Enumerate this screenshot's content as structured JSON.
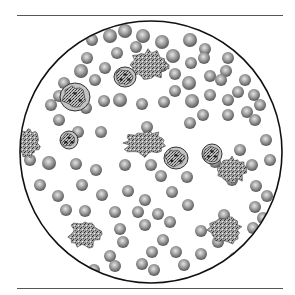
{
  "figure": {
    "colors": {
      "background": "#ffffff",
      "rule": "#555555",
      "field_outline": "#111111",
      "rbc_light": "#d8d8d8",
      "rbc_mid": "#9a9a9a",
      "rbc_dark": "#5a5a5a",
      "wbc_fill": "#b8b8b8",
      "wbc_nucleus": "#3a3a3a",
      "platelet_fill": "#8e8e8e"
    },
    "field": {
      "cx": 151,
      "cy": 152,
      "r": 131
    },
    "rbcs": [
      [
        92,
        40,
        6
      ],
      [
        110,
        36,
        7
      ],
      [
        125,
        31,
        7
      ],
      [
        143,
        36,
        7
      ],
      [
        162,
        42,
        7
      ],
      [
        190,
        40,
        7
      ],
      [
        205,
        49,
        6
      ],
      [
        228,
        58,
        6
      ],
      [
        87,
        58,
        6
      ],
      [
        81,
        71,
        7
      ],
      [
        117,
        53,
        6
      ],
      [
        136,
        47,
        6
      ],
      [
        173,
        56,
        7
      ],
      [
        191,
        63,
        6
      ],
      [
        204,
        58,
        6
      ],
      [
        226,
        71,
        6
      ],
      [
        245,
        80,
        6
      ],
      [
        254,
        95,
        6
      ],
      [
        64,
        83,
        6
      ],
      [
        95,
        80,
        6
      ],
      [
        105,
        68,
        6
      ],
      [
        127,
        77,
        6
      ],
      [
        162,
        66,
        6
      ],
      [
        175,
        74,
        6
      ],
      [
        189,
        83,
        7
      ],
      [
        210,
        76,
        6
      ],
      [
        221,
        80,
        6
      ],
      [
        238,
        92,
        6
      ],
      [
        51,
        105,
        6
      ],
      [
        59,
        96,
        6
      ],
      [
        120,
        100,
        7
      ],
      [
        142,
        104,
        6
      ],
      [
        164,
        102,
        6
      ],
      [
        175,
        91,
        6
      ],
      [
        192,
        101,
        7
      ],
      [
        210,
        95,
        6
      ],
      [
        228,
        100,
        6
      ],
      [
        247,
        112,
        6
      ],
      [
        260,
        105,
        6
      ],
      [
        86,
        108,
        6
      ],
      [
        104,
        101,
        6
      ],
      [
        59,
        120,
        6
      ],
      [
        78,
        132,
        6
      ],
      [
        101,
        132,
        6
      ],
      [
        147,
        127,
        6
      ],
      [
        190,
        123,
        6
      ],
      [
        203,
        115,
        6
      ],
      [
        228,
        115,
        6
      ],
      [
        255,
        120,
        6
      ],
      [
        266,
        140,
        6
      ],
      [
        30,
        160,
        6
      ],
      [
        49,
        163,
        7
      ],
      [
        76,
        164,
        6
      ],
      [
        96,
        170,
        6
      ],
      [
        125,
        165,
        6
      ],
      [
        151,
        165,
        6
      ],
      [
        161,
        176,
        6
      ],
      [
        187,
        177,
        6
      ],
      [
        215,
        162,
        6
      ],
      [
        240,
        150,
        6
      ],
      [
        252,
        165,
        6
      ],
      [
        40,
        185,
        6
      ],
      [
        58,
        196,
        6
      ],
      [
        82,
        185,
        6
      ],
      [
        102,
        195,
        6
      ],
      [
        128,
        191,
        6
      ],
      [
        145,
        200,
        6
      ],
      [
        172,
        192,
        6
      ],
      [
        232,
        180,
        6
      ],
      [
        256,
        186,
        6
      ],
      [
        66,
        210,
        6
      ],
      [
        85,
        211,
        6
      ],
      [
        115,
        212,
        6
      ],
      [
        138,
        212,
        6
      ],
      [
        158,
        214,
        6
      ],
      [
        170,
        222,
        6
      ],
      [
        188,
        205,
        6
      ],
      [
        224,
        215,
        6
      ],
      [
        255,
        207,
        6
      ],
      [
        267,
        196,
        6
      ],
      [
        123,
        242,
        6
      ],
      [
        120,
        229,
        6
      ],
      [
        145,
        225,
        6
      ],
      [
        163,
        240,
        6
      ],
      [
        176,
        252,
        6
      ],
      [
        201,
        231,
        6
      ],
      [
        218,
        242,
        6
      ],
      [
        253,
        228,
        6
      ],
      [
        110,
        256,
        6
      ],
      [
        115,
        266,
        6
      ],
      [
        142,
        264,
        6
      ],
      [
        152,
        252,
        6
      ],
      [
        184,
        265,
        6
      ],
      [
        201,
        254,
        6
      ],
      [
        235,
        258,
        6
      ],
      [
        94,
        270,
        6
      ],
      [
        154,
        270,
        6
      ],
      [
        263,
        218,
        6
      ],
      [
        270,
        160,
        6
      ]
    ],
    "wbcs": [
      {
        "cx": 75,
        "cy": 97,
        "rx": 15,
        "ry": 14,
        "type": "lymphocyte"
      },
      {
        "cx": 125,
        "cy": 77,
        "rx": 11,
        "ry": 10,
        "type": "monocyte"
      },
      {
        "cx": 69,
        "cy": 140,
        "rx": 9,
        "ry": 9,
        "type": "small lymphocyte"
      },
      {
        "cx": 176,
        "cy": 158,
        "rx": 12,
        "ry": 11,
        "type": "neutrophil"
      },
      {
        "cx": 212,
        "cy": 154,
        "rx": 10,
        "ry": 10,
        "type": "neutrophil"
      }
    ],
    "platelet_clumps": [
      {
        "cx": 148,
        "cy": 65,
        "rx": 18,
        "ry": 14
      },
      {
        "cx": 28,
        "cy": 143,
        "rx": 11,
        "ry": 14
      },
      {
        "cx": 145,
        "cy": 143,
        "rx": 19,
        "ry": 12
      },
      {
        "cx": 232,
        "cy": 170,
        "rx": 14,
        "ry": 12
      },
      {
        "cx": 85,
        "cy": 234,
        "rx": 15,
        "ry": 12
      },
      {
        "cx": 225,
        "cy": 230,
        "rx": 15,
        "ry": 13
      }
    ]
  }
}
